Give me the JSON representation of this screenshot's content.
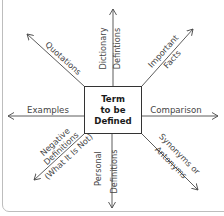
{
  "diagram": {
    "center": {
      "lines": [
        "Term",
        "to be",
        "Defined"
      ]
    },
    "spokes": {
      "up": {
        "lines": [
          "Dictionary",
          "Defintions"
        ]
      },
      "down": {
        "lines": [
          "Personal",
          "Definitions"
        ]
      },
      "left": {
        "lines": [
          "Examples"
        ]
      },
      "right": {
        "lines": [
          "Comparison"
        ]
      },
      "upper_left": {
        "lines": [
          "Quotations"
        ]
      },
      "upper_right": {
        "lines": [
          "Important",
          "Facts"
        ]
      },
      "lower_left": {
        "lines": [
          "Negative",
          "Definitions",
          "(What It Is Not)"
        ]
      },
      "lower_right": {
        "lines": [
          "Synonyms or",
          "Antonyms"
        ]
      }
    },
    "colors": {
      "line": "#4a4a4a",
      "text": "#444444",
      "center_text": "#1a1a1a",
      "frame": "#bdbdbd"
    }
  }
}
